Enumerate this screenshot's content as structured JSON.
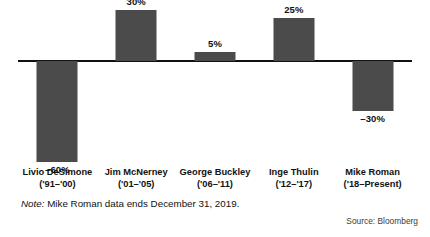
{
  "chart_data": {
    "type": "bar",
    "title": "",
    "subtitle": "",
    "xlabel": "",
    "ylabel": "",
    "grid": false,
    "legend": null,
    "ylim": [
      -60,
      30
    ],
    "categories": [
      "Livio DeSimone",
      "Jim McNerney",
      "George Buckley",
      "Inge Thulin",
      "Mike Roman"
    ],
    "category_sublabels": [
      "('91–'00)",
      "('01–'05)",
      "('06–'11)",
      "('12–'17)",
      "('18–Present)"
    ],
    "values": [
      -60,
      30,
      5,
      25,
      -30
    ],
    "value_labels": [
      "–60%",
      "30%",
      "5%",
      "25%",
      "–30%"
    ],
    "bar_color": "#4b4b4b",
    "axis_color": "#111111",
    "background": "#ffffff"
  },
  "footnotes": {
    "note_word": "Note:",
    "note_text": " Mike Roman data ends December 31, 2019.",
    "source": "Source: Bloomberg"
  }
}
